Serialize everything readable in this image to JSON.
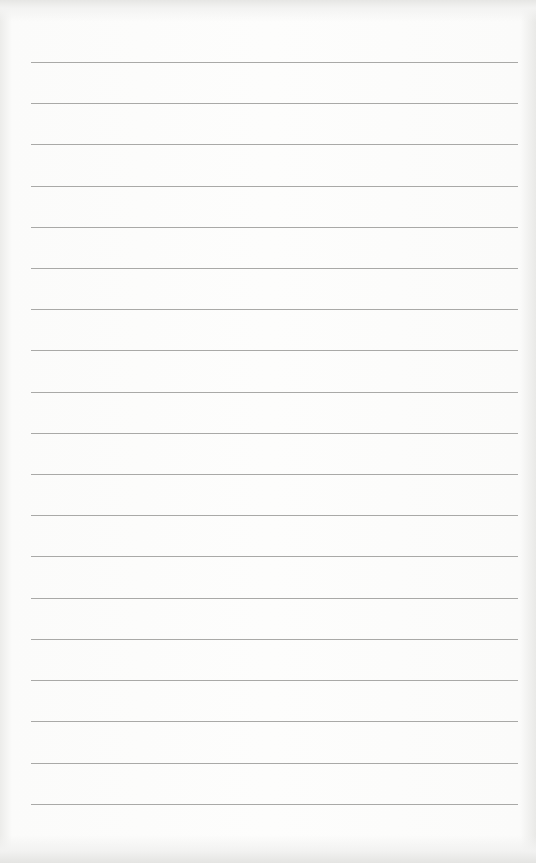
{
  "page": {
    "type": "lined-paper",
    "background_color": "#fdfdfc",
    "line_color": "#a9a9a7",
    "line_count": 19,
    "lines_y": [
      62,
      103,
      144,
      186,
      227,
      268,
      309,
      350,
      392,
      433,
      474,
      515,
      556,
      598,
      639,
      680,
      721,
      763,
      804
    ]
  }
}
